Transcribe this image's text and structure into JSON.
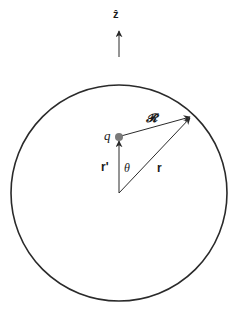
{
  "diagram": {
    "labels": {
      "z_hat": "ẑ",
      "charge": "q",
      "separation": "𝓡",
      "source_position": "r'",
      "angle": "θ",
      "field_position": "r"
    },
    "colors": {
      "stroke": "#2a2a2a",
      "charge_fill": "#7a7a7a",
      "background": "#ffffff"
    }
  }
}
